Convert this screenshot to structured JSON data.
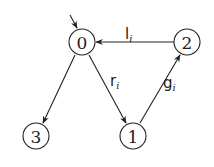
{
  "diagram": {
    "type": "state-transition-graph",
    "initial_state": "0",
    "nodes": [
      {
        "id": "0",
        "label": "0",
        "x": 82,
        "y": 42
      },
      {
        "id": "1",
        "label": "1",
        "x": 133,
        "y": 136
      },
      {
        "id": "2",
        "label": "2",
        "x": 187,
        "y": 42
      },
      {
        "id": "3",
        "label": "3",
        "x": 36,
        "y": 136
      }
    ],
    "edges": [
      {
        "from": "2",
        "to": "0",
        "label": "l",
        "subscript": "i"
      },
      {
        "from": "0",
        "to": "1",
        "label": "r",
        "subscript": "i"
      },
      {
        "from": "1",
        "to": "2",
        "label": "g",
        "subscript": "i"
      },
      {
        "from": "0",
        "to": "3",
        "label": "",
        "subscript": ""
      }
    ],
    "colors": {
      "stroke": "#222222",
      "background": "#ffffff"
    }
  }
}
